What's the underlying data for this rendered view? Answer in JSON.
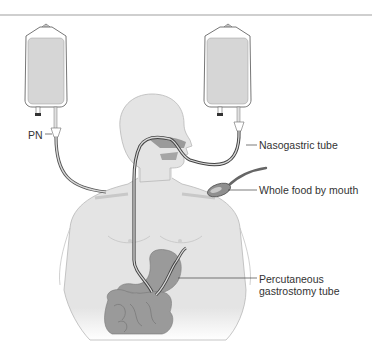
{
  "figure": {
    "type": "medical-illustration",
    "colors": {
      "body_fill": "#e4e4e4",
      "body_outline": "#b8b8b8",
      "organ_fill": "#9a9a9a",
      "tube": "#555555",
      "bag_fill": "#d6d6d6",
      "bag_outline": "#666666",
      "divider": "#cfcfcf",
      "label_text": "#333333"
    }
  },
  "labels": {
    "pn": "PN",
    "nasogastric": "Nasogastric tube",
    "whole_food": "Whole food by mouth",
    "peg_line1": "Percutaneous",
    "peg_line2": "gastrostomy tube"
  }
}
